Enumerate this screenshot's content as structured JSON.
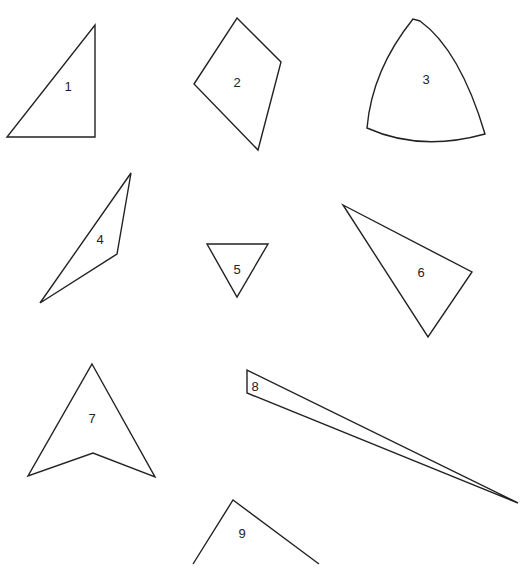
{
  "shapes": [
    {
      "id": "1",
      "label": "1"
    },
    {
      "id": "2",
      "label": "2"
    },
    {
      "id": "3",
      "label": "3"
    },
    {
      "id": "4",
      "label": "4"
    },
    {
      "id": "5",
      "label": "5"
    },
    {
      "id": "6",
      "label": "6"
    },
    {
      "id": "7",
      "label": "7"
    },
    {
      "id": "8",
      "label": "8"
    },
    {
      "id": "9",
      "label": "9"
    }
  ],
  "colors": {
    "stroke": "#222222",
    "background": "#ffffff"
  }
}
